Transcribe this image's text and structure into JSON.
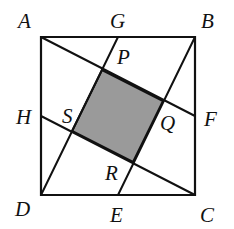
{
  "diagram": {
    "type": "geometry",
    "colors": {
      "stroke": "#111111",
      "shade": "#9a9a9a",
      "background": "#ffffff"
    },
    "labels": {
      "A": "A",
      "B": "B",
      "C": "C",
      "D": "D",
      "E": "E",
      "F": "F",
      "G": "G",
      "H": "H",
      "P": "P",
      "Q": "Q",
      "R": "R",
      "S": "S"
    },
    "points": {
      "A": [
        41,
        37
      ],
      "B": [
        195,
        37
      ],
      "C": [
        195,
        195
      ],
      "D": [
        41,
        195
      ],
      "G": [
        118,
        37
      ],
      "F": [
        195,
        116
      ],
      "E": [
        118,
        195
      ],
      "H": [
        41,
        116
      ],
      "P": [
        102,
        70
      ],
      "Q": [
        163,
        101
      ],
      "R": [
        133,
        162
      ],
      "S": [
        72,
        131
      ]
    },
    "segments": [
      [
        "A",
        "F"
      ],
      [
        "G",
        "D"
      ],
      [
        "H",
        "C"
      ],
      [
        "B",
        "E"
      ]
    ],
    "shaded_region": [
      "P",
      "Q",
      "R",
      "S"
    ]
  }
}
